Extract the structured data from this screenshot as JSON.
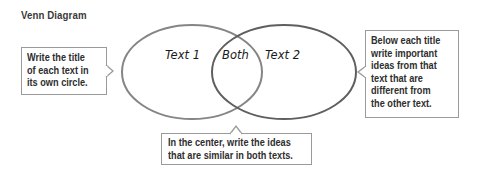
{
  "title": "Venn Diagram",
  "diagram": {
    "type": "venn",
    "circles": [
      {
        "label": "Text 1",
        "color": "#7a7a7a"
      },
      {
        "label": "Text 2",
        "color": "#7a7a7a"
      }
    ],
    "overlap_label": "Both"
  },
  "callouts": {
    "left": {
      "text": "Write the title\nof each text in\nits own circle.",
      "points_to": "left-circle"
    },
    "right": {
      "text": "Below each title\nwrite important\nideas from that\ntext that are\ndifferent from\nthe other text.",
      "points_to": "right-circle"
    },
    "bottom": {
      "text": "In the center, write the ideas\nthat are similar in both texts.",
      "points_to": "overlap"
    }
  },
  "colors": {
    "text": "#2e2e2e",
    "outline": "#7a7a7a",
    "callout_border": "#9a9a9a",
    "background": "#ffffff"
  }
}
